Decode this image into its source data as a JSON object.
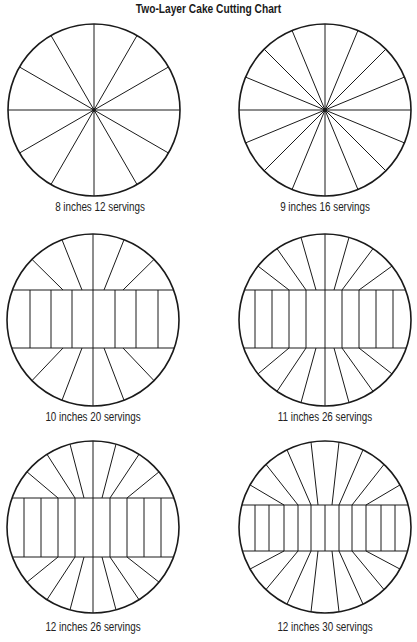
{
  "title": "Two-Layer Cake Cutting Chart",
  "colors": {
    "background": "#ffffff",
    "stroke": "#1a1a1a"
  },
  "cakes": [
    {
      "id": "c1",
      "label": "8 inches 12 servings",
      "size_in": 8,
      "servings": 12,
      "style": "radial",
      "cx": 94,
      "cy": 110,
      "r": 86,
      "spokes": 12,
      "caption_x": 0,
      "caption_y": 200
    },
    {
      "id": "c2",
      "label": "9 inches 16 servings",
      "size_in": 9,
      "servings": 16,
      "style": "radial",
      "cx": 325,
      "cy": 110,
      "r": 86,
      "spokes": 16,
      "caption_x": 225,
      "caption_y": 200
    },
    {
      "id": "c3",
      "label": "10 inches 20 servings",
      "size_in": 10,
      "servings": 20,
      "style": "band",
      "cx": 93,
      "cy": 320,
      "r": 86,
      "band_top": 290,
      "band_bottom": 348,
      "band_x": [
        30,
        51,
        72,
        93,
        115,
        136,
        158
      ],
      "top_rays": [
        [
          63,
          290,
          32
        ],
        [
          82,
          290,
          62
        ],
        [
          93,
          290,
          93
        ],
        [
          104,
          290,
          124
        ],
        [
          123,
          290,
          154
        ]
      ],
      "bottom_rays": [
        [
          63,
          348,
          32
        ],
        [
          82,
          348,
          62
        ],
        [
          93,
          348,
          93
        ],
        [
          104,
          348,
          124
        ],
        [
          123,
          348,
          154
        ]
      ],
      "caption_x": -7,
      "caption_y": 410
    },
    {
      "id": "c4",
      "label": "11 inches 26 servings",
      "size_in": 11,
      "servings": 26,
      "style": "band",
      "cx": 325,
      "cy": 320,
      "r": 86,
      "band_top": 290,
      "band_bottom": 348,
      "band_x": [
        255,
        272,
        289,
        306,
        325,
        342,
        359,
        376,
        393
      ],
      "top_rays": [
        [
          289,
          290,
          258
        ],
        [
          306,
          290,
          277
        ],
        [
          316,
          290,
          301
        ],
        [
          325,
          290,
          325
        ],
        [
          334,
          290,
          349
        ],
        [
          342,
          290,
          373
        ],
        [
          359,
          290,
          392
        ]
      ],
      "bottom_rays": [
        [
          289,
          348,
          258
        ],
        [
          306,
          348,
          277
        ],
        [
          316,
          348,
          301
        ],
        [
          325,
          348,
          325
        ],
        [
          334,
          348,
          349
        ],
        [
          342,
          348,
          373
        ],
        [
          359,
          348,
          392
        ]
      ],
      "caption_x": 225,
      "caption_y": 410
    },
    {
      "id": "c5",
      "label": "12 inches 26 servings",
      "size_in": 12,
      "servings": 26,
      "style": "band",
      "cx": 93,
      "cy": 527,
      "r": 86,
      "band_top": 498,
      "band_bottom": 557,
      "band_x": [
        24,
        41,
        58,
        75,
        93,
        110,
        127,
        144,
        161
      ],
      "top_rays": [
        [
          58,
          498,
          27
        ],
        [
          75,
          498,
          47
        ],
        [
          84,
          498,
          70
        ],
        [
          93,
          498,
          93
        ],
        [
          102,
          498,
          116
        ],
        [
          110,
          498,
          139
        ],
        [
          127,
          498,
          159
        ]
      ],
      "bottom_rays": [
        [
          58,
          557,
          27
        ],
        [
          75,
          557,
          47
        ],
        [
          84,
          557,
          70
        ],
        [
          93,
          557,
          93
        ],
        [
          102,
          557,
          116
        ],
        [
          110,
          557,
          139
        ],
        [
          127,
          557,
          159
        ]
      ],
      "caption_x": -7,
      "caption_y": 622
    },
    {
      "id": "c6",
      "label": "12 inches 30 servings",
      "size_in": 12,
      "servings": 30,
      "style": "band",
      "cx": 325,
      "cy": 527,
      "r": 86,
      "band_top": 505,
      "band_bottom": 551,
      "band_x": [
        255,
        269,
        284,
        298,
        311,
        325,
        339,
        352,
        366,
        381,
        395
      ],
      "top_rays": [
        [
          284,
          505,
          250
        ],
        [
          298,
          505,
          266
        ],
        [
          311,
          505,
          287
        ],
        [
          318,
          505,
          311
        ],
        [
          332,
          505,
          339
        ],
        [
          339,
          505,
          363
        ],
        [
          352,
          505,
          384
        ],
        [
          366,
          505,
          400
        ]
      ],
      "bottom_rays": [
        [
          284,
          551,
          250
        ],
        [
          298,
          551,
          266
        ],
        [
          311,
          551,
          287
        ],
        [
          318,
          551,
          311
        ],
        [
          332,
          551,
          339
        ],
        [
          339,
          551,
          363
        ],
        [
          352,
          551,
          384
        ],
        [
          366,
          551,
          400
        ]
      ],
      "caption_x": 225,
      "caption_y": 622
    }
  ]
}
